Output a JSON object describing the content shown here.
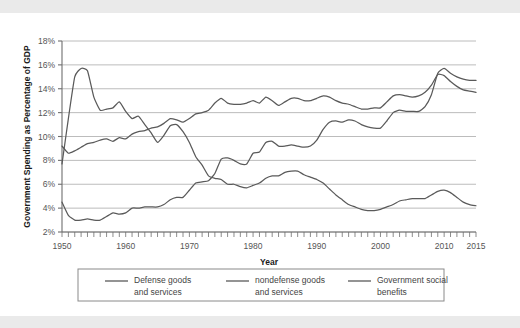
{
  "figure": {
    "background_color": "#ffffff",
    "band_color": "#eaeaea",
    "line_color": "#5a5a5a",
    "grid_color": "#b4b4b4",
    "axis_color": "#6e6e6e"
  },
  "axes": {
    "y_title": "Government Spending as Percentage of GDP",
    "x_title": "Year",
    "y_ticks": [
      "2%",
      "4%",
      "6%",
      "8%",
      "10%",
      "12%",
      "14%",
      "16%",
      "18%"
    ],
    "x_ticks": [
      "1950",
      "1960",
      "1970",
      "1980",
      "1990",
      "2000",
      "2010",
      "2015"
    ]
  },
  "legend": {
    "items": [
      {
        "label_line1": "Defense goods",
        "label_line2": "and services"
      },
      {
        "label_line1": "nondefense goods",
        "label_line2": "and services"
      },
      {
        "label_line1": "Government social",
        "label_line2": "benefits"
      }
    ]
  },
  "chart_data": {
    "type": "line",
    "title": "",
    "xlabel": "Year",
    "ylabel": "Government Spending as Percentage of GDP",
    "xlim": [
      1950,
      2015
    ],
    "ylim": [
      2,
      18
    ],
    "ytick_step": 2,
    "xtick_step": 1,
    "xtick_labeled": [
      1950,
      1960,
      1970,
      1980,
      1990,
      2000,
      2010,
      2015
    ],
    "grid": "horizontal",
    "legend_position": "below",
    "x": [
      1950,
      1951,
      1952,
      1953,
      1954,
      1955,
      1956,
      1957,
      1958,
      1959,
      1960,
      1961,
      1962,
      1963,
      1964,
      1965,
      1966,
      1967,
      1968,
      1969,
      1970,
      1971,
      1972,
      1973,
      1974,
      1975,
      1976,
      1977,
      1978,
      1979,
      1980,
      1981,
      1982,
      1983,
      1984,
      1985,
      1986,
      1987,
      1988,
      1989,
      1990,
      1991,
      1992,
      1993,
      1994,
      1995,
      1996,
      1997,
      1998,
      1999,
      2000,
      2001,
      2002,
      2003,
      2004,
      2005,
      2006,
      2007,
      2008,
      2009,
      2010,
      2011,
      2012,
      2013,
      2014,
      2015
    ],
    "series": [
      {
        "name": "Defense goods and services",
        "values": [
          7.7,
          11.5,
          15.0,
          15.7,
          15.5,
          13.3,
          12.2,
          12.3,
          12.4,
          12.9,
          12.1,
          11.5,
          11.7,
          11.0,
          10.3,
          9.5,
          10.1,
          10.9,
          11.0,
          10.4,
          9.5,
          8.3,
          7.6,
          6.7,
          6.5,
          6.4,
          6.0,
          6.0,
          5.8,
          5.7,
          5.9,
          6.1,
          6.5,
          6.7,
          6.7,
          7.0,
          7.1,
          7.1,
          6.8,
          6.6,
          6.4,
          6.1,
          5.6,
          5.1,
          4.7,
          4.3,
          4.1,
          3.9,
          3.8,
          3.8,
          3.9,
          4.1,
          4.3,
          4.6,
          4.7,
          4.8,
          4.8,
          4.8,
          5.1,
          5.4,
          5.5,
          5.3,
          4.9,
          4.5,
          4.3,
          4.2
        ]
      },
      {
        "name": "nondefense goods and services",
        "values": [
          9.2,
          8.6,
          8.8,
          9.1,
          9.4,
          9.5,
          9.7,
          9.8,
          9.6,
          9.9,
          9.8,
          10.2,
          10.4,
          10.5,
          10.7,
          10.8,
          11.1,
          11.5,
          11.4,
          11.2,
          11.5,
          11.9,
          12.0,
          12.2,
          12.8,
          13.2,
          12.8,
          12.7,
          12.7,
          12.8,
          13.0,
          12.8,
          13.3,
          13.0,
          12.6,
          12.9,
          13.2,
          13.2,
          13.0,
          13.0,
          13.2,
          13.4,
          13.3,
          13.0,
          12.8,
          12.7,
          12.5,
          12.3,
          12.3,
          12.4,
          12.4,
          12.9,
          13.4,
          13.5,
          13.4,
          13.3,
          13.4,
          13.7,
          14.3,
          15.2,
          15.1,
          14.6,
          14.2,
          13.9,
          13.8,
          13.7
        ]
      },
      {
        "name": "Government social benefits",
        "values": [
          4.5,
          3.4,
          3.0,
          3.0,
          3.1,
          3.0,
          3.0,
          3.3,
          3.6,
          3.5,
          3.6,
          4.0,
          4.0,
          4.1,
          4.1,
          4.1,
          4.3,
          4.7,
          4.9,
          4.9,
          5.5,
          6.1,
          6.2,
          6.3,
          6.9,
          8.1,
          8.2,
          8.0,
          7.7,
          7.7,
          8.6,
          8.7,
          9.5,
          9.6,
          9.2,
          9.2,
          9.3,
          9.2,
          9.1,
          9.2,
          9.7,
          10.6,
          11.2,
          11.3,
          11.2,
          11.4,
          11.3,
          11.0,
          10.8,
          10.7,
          10.7,
          11.3,
          12.0,
          12.2,
          12.1,
          12.1,
          12.1,
          12.5,
          13.5,
          15.3,
          15.7,
          15.3,
          15.0,
          14.8,
          14.7,
          14.7
        ]
      }
    ]
  }
}
